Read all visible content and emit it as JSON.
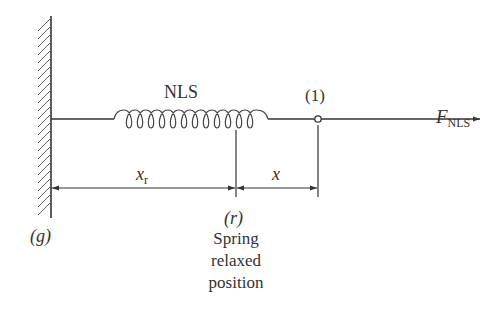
{
  "diagram": {
    "spring_label": "NLS",
    "node_label": "(1)",
    "force": {
      "symbol": "F",
      "subscript": "NLS"
    },
    "ground_label": "(g)",
    "relaxed_label": "(r)",
    "relaxed_caption": [
      "Spring",
      "relaxed",
      "position"
    ],
    "dim_xr": {
      "symbol": "x",
      "subscript": "r"
    },
    "dim_x": "x",
    "colors": {
      "line": "#333333",
      "background": "#ffffff"
    }
  }
}
